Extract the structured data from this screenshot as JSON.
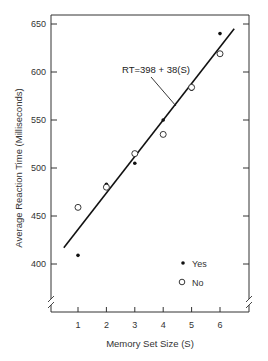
{
  "chart_data": {
    "type": "scatter",
    "title": "",
    "xlabel": "Memory Set Size (S)",
    "ylabel": "Average Reaction Time (Milliseconds)",
    "x": [
      1,
      2,
      3,
      4,
      5,
      6
    ],
    "xticks": [
      "1",
      "2",
      "3",
      "4",
      "5",
      "6"
    ],
    "yticks": [
      "400",
      "450",
      "500",
      "550",
      "600",
      "650"
    ],
    "xlim": [
      0,
      7
    ],
    "ylim": [
      350,
      660
    ],
    "axis_break": true,
    "grid": false,
    "legend_position": "lower right inside",
    "series": [
      {
        "name": "Yes",
        "marker": "filled-circle",
        "values": [
          409,
          483,
          505,
          550,
          582,
          640
        ]
      },
      {
        "name": "No",
        "marker": "open-circle",
        "values": [
          459,
          480,
          515,
          535,
          584,
          619
        ]
      }
    ],
    "fit_line": {
      "label": "RT=398 + 38(S)",
      "intercept": 398,
      "slope": 38,
      "x_range": [
        0.5,
        6.5
      ]
    },
    "annotations": [
      "RT=398 + 38(S)"
    ]
  },
  "legend": {
    "yes_label": "Yes",
    "no_label": "No"
  }
}
